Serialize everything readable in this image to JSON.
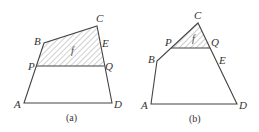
{
  "figure": {
    "panels": [
      {
        "id": "a",
        "caption": "(a)",
        "region_label": "f",
        "points": {
          "A": {
            "label": "A",
            "x": 24,
            "y": 103
          },
          "B": {
            "label": "B",
            "x": 44,
            "y": 43
          },
          "C": {
            "label": "C",
            "x": 97,
            "y": 26
          },
          "D": {
            "label": "D",
            "x": 112,
            "y": 103
          },
          "E": {
            "label": "E",
            "x": 101,
            "y": 47
          },
          "P": {
            "label": "P",
            "x": 36,
            "y": 66
          },
          "Q": {
            "label": "Q",
            "x": 104,
            "y": 66
          }
        },
        "shaded_region": "B-C-Q-P",
        "colors": {
          "stroke": "#444444",
          "hatch": "#777777",
          "text": "#333333"
        }
      },
      {
        "id": "b",
        "caption": "(b)",
        "region_label": "f",
        "points": {
          "A": {
            "label": "A",
            "x": 151,
            "y": 104
          },
          "B": {
            "label": "B",
            "x": 157,
            "y": 61
          },
          "C": {
            "label": "C",
            "x": 198,
            "y": 23
          },
          "D": {
            "label": "D",
            "x": 237,
            "y": 104
          },
          "E": {
            "label": "E",
            "x": 216,
            "y": 60
          },
          "P": {
            "label": "P",
            "x": 171,
            "y": 48
          },
          "Q": {
            "label": "Q",
            "x": 210,
            "y": 48
          }
        },
        "shaded_region": "C-Q-P",
        "colors": {
          "stroke": "#444444",
          "hatch": "#777777",
          "text": "#333333"
        }
      }
    ]
  }
}
